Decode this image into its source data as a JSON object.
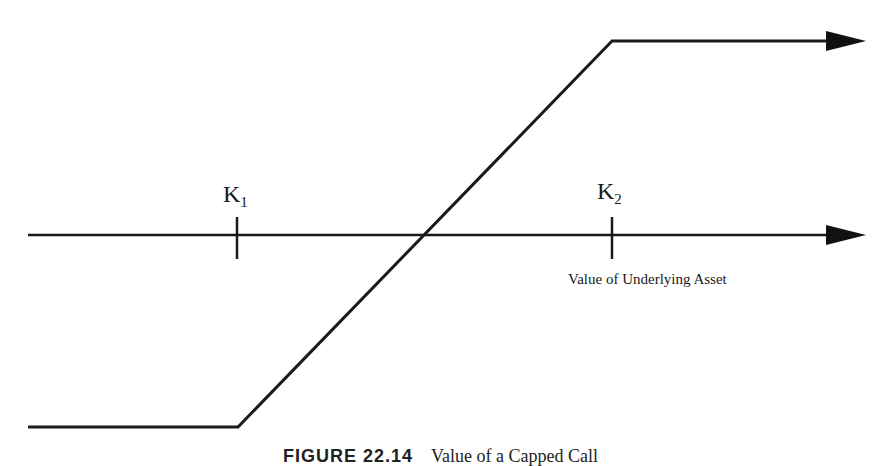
{
  "diagram": {
    "type": "payoff-diagram",
    "strikes": [
      {
        "name": "K",
        "subscript": "1"
      },
      {
        "name": "K",
        "subscript": "2"
      }
    ],
    "x_axis_label": "Value of Underlying Asset",
    "caption": {
      "figure_number": "FIGURE 22.14",
      "title": "Value of a Capped Call"
    },
    "colors": {
      "line": "#1a1a1a",
      "background": "#ffffff"
    }
  }
}
